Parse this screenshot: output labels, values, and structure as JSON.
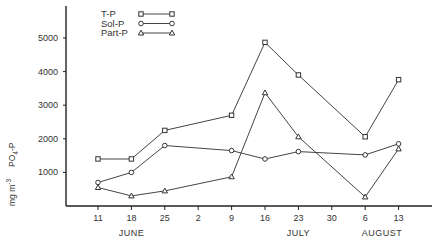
{
  "chart_data": {
    "type": "line",
    "title": "",
    "xlabel": "",
    "ylabel": "mg m-3 PO4-P",
    "ylabel_parts": {
      "unit": "mg m",
      "exp": "-3",
      "species": "PO",
      "sub": "4",
      "suffix": "-P"
    },
    "ylim": [
      0,
      5800
    ],
    "yticks": [
      1000,
      2000,
      3000,
      4000,
      5000
    ],
    "ytick_labels": [
      "1000",
      "2000",
      "3000",
      "4000",
      "5000"
    ],
    "categories": [
      "11",
      "18",
      "25",
      "2",
      "9",
      "16",
      "23",
      "30",
      "6",
      "13"
    ],
    "months": [
      {
        "label": "JUNE",
        "center_index": 1
      },
      {
        "label": "JULY",
        "center_index": 6
      },
      {
        "label": "AUGUST",
        "center_index": 8.5
      }
    ],
    "grid": false,
    "legend_position": "top-left",
    "series": [
      {
        "name": "T-P",
        "marker": "square",
        "points": [
          [
            0,
            1400
          ],
          [
            1,
            1400
          ],
          [
            2,
            2250
          ],
          [
            4,
            2700
          ],
          [
            5,
            4870
          ],
          [
            6,
            3900
          ],
          [
            8,
            2060
          ],
          [
            9,
            3760
          ]
        ]
      },
      {
        "name": "Sol-P",
        "marker": "circle",
        "points": [
          [
            0,
            700
          ],
          [
            1,
            1000
          ],
          [
            2,
            1800
          ],
          [
            4,
            1650
          ],
          [
            5,
            1400
          ],
          [
            6,
            1620
          ],
          [
            8,
            1520
          ],
          [
            9,
            1850
          ]
        ]
      },
      {
        "name": "Part-P",
        "marker": "triangle",
        "points": [
          [
            0,
            550
          ],
          [
            1,
            300
          ],
          [
            2,
            450
          ],
          [
            4,
            870
          ],
          [
            5,
            3370
          ],
          [
            6,
            2060
          ],
          [
            8,
            270
          ],
          [
            9,
            1700
          ]
        ]
      }
    ]
  }
}
